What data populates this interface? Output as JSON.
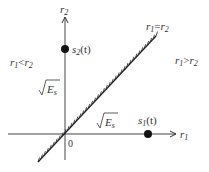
{
  "diagram": {
    "type": "decision-region-plot",
    "axes": {
      "x_label": {
        "base": "r",
        "sub": "1"
      },
      "y_label": {
        "base": "r",
        "sub": "2"
      },
      "origin_label": "0"
    },
    "points": [
      {
        "name": "s1",
        "label_base": "s",
        "label_sub": "1",
        "label_arg": "(t)",
        "x": "√E_s",
        "y": "0"
      },
      {
        "name": "s2",
        "label_base": "s",
        "label_sub": "2",
        "label_arg": "(t)",
        "x": "0",
        "y": "√E_s"
      }
    ],
    "boundary": {
      "label_left": "r",
      "sub1": "1",
      "op": "=",
      "label_right": "r",
      "sub2": "2"
    },
    "regions": [
      {
        "name": "region-r1-less-r2",
        "left": "r",
        "sub1": "1",
        "op": "<",
        "right": "r",
        "sub2": "2"
      },
      {
        "name": "region-r1-greater-r2",
        "left": "r",
        "sub1": "1",
        "op": ">",
        "right": "r",
        "sub2": "2"
      }
    ],
    "tick_labels": {
      "sqrt_symbol": "√",
      "energy_base": "E",
      "energy_sub": "s"
    }
  },
  "colors": {
    "line": "#333333",
    "point": "#111111"
  }
}
